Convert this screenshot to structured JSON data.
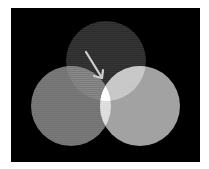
{
  "diagram": {
    "type": "venn",
    "background": "#000000",
    "frame": {
      "x": 11,
      "y": 8,
      "width": 189,
      "height": 154
    },
    "circles": [
      {
        "name": "top",
        "cx": 106,
        "cy": 61,
        "r": 40,
        "color": "#2b2b2b"
      },
      {
        "name": "left",
        "cx": 71,
        "cy": 106,
        "r": 40,
        "color": "#727272"
      },
      {
        "name": "right",
        "cx": 140,
        "cy": 106,
        "r": 40,
        "color": "#a2a2a2"
      }
    ],
    "overlaps": {
      "top_left": "#7a7a7a",
      "top_right": "#c6c6c6",
      "left_right": "#dcdcdc",
      "all_three": "#ffffff"
    },
    "arrow": {
      "x1": 86,
      "y1": 52,
      "x2": 102,
      "y2": 78,
      "color": "#cfcfcf"
    }
  }
}
